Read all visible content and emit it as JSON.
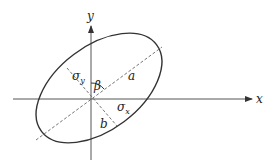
{
  "diagram": {
    "type": "ellipse-axes",
    "axes": {
      "x_label": "x",
      "y_label": "y"
    },
    "labels": {
      "sigma_y": "σ",
      "sigma_y_sub": "y",
      "sigma_x": "σ",
      "sigma_x_sub": "x",
      "beta": "β",
      "major": "a",
      "minor": "b"
    },
    "colors": {
      "stroke": "#333333",
      "dashed": "#555555",
      "background": "#ffffff"
    }
  }
}
